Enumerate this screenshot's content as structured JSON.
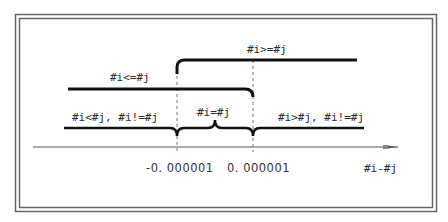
{
  "diagram": {
    "axis": {
      "label": "#i-#j",
      "ticks": [
        {
          "value": -1e-06,
          "label": "-0. 000001"
        },
        {
          "value": 1e-06,
          "label": "0. 000001"
        }
      ]
    },
    "ranges": [
      {
        "id": "ge",
        "label": "#i>=#j",
        "from": "-0.000001",
        "to": "+inf"
      },
      {
        "id": "le",
        "label": "#i<=#j",
        "from": "-inf",
        "to": "0.000001"
      },
      {
        "id": "lt",
        "label": "#i<#j, #i!=#j",
        "from": "-inf",
        "to": "-0.000001"
      },
      {
        "id": "eq",
        "label": "#i=#j",
        "from": "-0.000001",
        "to": "0.000001"
      },
      {
        "id": "gt",
        "label": "#i>#j, #i!=#j",
        "from": "0.000001",
        "to": "+inf"
      }
    ],
    "colors": {
      "line": "#111111",
      "axis": "#555555",
      "border": "#666666",
      "dash": "#777777"
    }
  }
}
